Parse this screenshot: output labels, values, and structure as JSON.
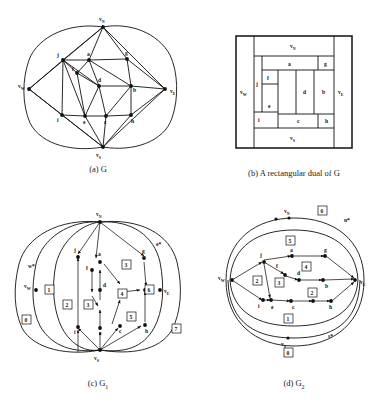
{
  "figure": {
    "line_color": "#111111",
    "background": "#ffffff"
  },
  "panels": [
    {
      "id": "a",
      "caption": "(a)  G",
      "caption_main": "G",
      "inner_vertices": [
        "a",
        "b",
        "c",
        "d",
        "e",
        "f",
        "g",
        "h",
        "i",
        "j"
      ],
      "outer_vertices": [
        {
          "label": "v",
          "sub": "N",
          "position": "top"
        },
        {
          "label": "v",
          "sub": "W",
          "position": "left"
        },
        {
          "label": "v",
          "sub": "E",
          "position": "right"
        },
        {
          "label": "v",
          "sub": "S",
          "position": "bottom"
        }
      ]
    },
    {
      "id": "b",
      "caption": "(b)  A rectangular dual of G",
      "rooms": [
        "a",
        "b",
        "c",
        "d",
        "e",
        "f",
        "g",
        "h",
        "i",
        "j"
      ],
      "border_rooms": [
        {
          "label": "v",
          "sub": "N",
          "side": "north"
        },
        {
          "label": "v",
          "sub": "W",
          "side": "west"
        },
        {
          "label": "v",
          "sub": "E",
          "side": "east"
        },
        {
          "label": "v",
          "sub": "S",
          "side": "south"
        }
      ]
    },
    {
      "id": "c",
      "caption": "(c)  G",
      "caption_sub": "1",
      "inner_vertices": [
        "a",
        "b",
        "c",
        "d",
        "e",
        "f",
        "g",
        "h",
        "i",
        "j"
      ],
      "outer_vertices": [
        {
          "label": "v",
          "sub": "N",
          "position": "top"
        },
        {
          "label": "v",
          "sub": "W",
          "position": "left"
        },
        {
          "label": "v",
          "sub": "E",
          "position": "right"
        },
        {
          "label": "v",
          "sub": "S",
          "position": "bottom"
        }
      ],
      "star_labels": [
        {
          "label": "w*",
          "position": "left"
        },
        {
          "label": "e*",
          "position": "right"
        }
      ],
      "face_numbers": [
        "0",
        "1",
        "2",
        "3",
        "3",
        "4",
        "5",
        "5",
        "6",
        "7"
      ]
    },
    {
      "id": "d",
      "caption": "(d)  G",
      "caption_sub": "2",
      "inner_vertices": [
        "a",
        "b",
        "c",
        "d",
        "e",
        "f",
        "g",
        "h",
        "i",
        "j"
      ],
      "outer_vertices": [
        {
          "label": "v",
          "sub": "N",
          "position": "top"
        },
        {
          "label": "v",
          "sub": "W",
          "position": "left"
        },
        {
          "label": "v",
          "sub": "E",
          "position": "right"
        },
        {
          "label": "v",
          "sub": "S",
          "position": "bottom"
        }
      ],
      "star_labels": [
        {
          "label": "n*",
          "position": "top-right"
        },
        {
          "label": "s*",
          "position": "bottom-right"
        }
      ],
      "face_numbers": [
        "0",
        "1",
        "2",
        "2",
        "3",
        "4",
        "5",
        "6"
      ]
    }
  ]
}
